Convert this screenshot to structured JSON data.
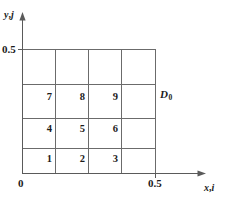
{
  "figure": {
    "background_color": "#ffffff",
    "line_color": "#6b6b6b",
    "axis_color": "#5a5a5a",
    "text_color": "#1b1b1b"
  },
  "axes": {
    "y_axis": {
      "name": "y",
      "separator": ",",
      "index": "j",
      "label": "y, j",
      "arrow": "arrow-up"
    },
    "x_axis": {
      "name": "x",
      "separator": ",",
      "index": "i",
      "label": "x, i",
      "arrow": "arrow-right"
    },
    "origin_label": "0",
    "y_tick_label": "0.5",
    "x_tick_label": "0.5"
  },
  "domain": {
    "label_d": "D",
    "label_sub": "0",
    "label": "D0",
    "x_range": [
      0,
      0.5
    ],
    "y_range": [
      0,
      0.5
    ],
    "columns": 4,
    "rows": 4
  },
  "grid": {
    "cells": [
      {
        "index": "1",
        "col": 0,
        "row": 0
      },
      {
        "index": "2",
        "col": 1,
        "row": 0
      },
      {
        "index": "3",
        "col": 2,
        "row": 0
      },
      {
        "index": "4",
        "col": 0,
        "row": 1
      },
      {
        "index": "5",
        "col": 1,
        "row": 1
      },
      {
        "index": "6",
        "col": 2,
        "row": 1
      },
      {
        "index": "7",
        "col": 0,
        "row": 2
      },
      {
        "index": "8",
        "col": 1,
        "row": 2
      },
      {
        "index": "9",
        "col": 2,
        "row": 2
      }
    ]
  }
}
